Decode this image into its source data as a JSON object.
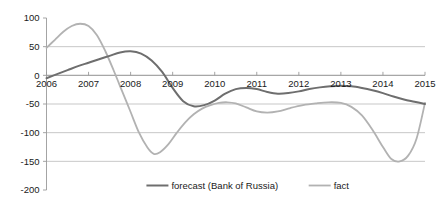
{
  "chart_data": {
    "type": "line",
    "title": "",
    "subtitle": "",
    "xlabel": "",
    "ylabel": "",
    "grid": true,
    "legend_position": "bottom",
    "xlim": [
      2006,
      2015
    ],
    "ylim": [
      -200,
      100
    ],
    "ytick_labels": [
      "100",
      "50",
      "0",
      "-50",
      "-100",
      "-150",
      "-200"
    ],
    "yticks": [
      100,
      50,
      0,
      -50,
      -100,
      -150,
      -200
    ],
    "xtick_labels": [
      "2006",
      "2007",
      "2008",
      "2009",
      "2010",
      "2011",
      "2012",
      "2013",
      "2014",
      "2015"
    ],
    "xticks": [
      2006,
      2007,
      2008,
      2009,
      2010,
      2011,
      2012,
      2013,
      2014,
      2015
    ],
    "series": [
      {
        "name": "forecast (Bank of Russia)",
        "color": "#6e6e6e",
        "width": 2.0,
        "x": [
          2006.0,
          2006.25,
          2006.5,
          2006.75,
          2007.0,
          2007.25,
          2007.5,
          2007.75,
          2008.0,
          2008.25,
          2008.5,
          2008.75,
          2009.0,
          2009.25,
          2009.5,
          2009.75,
          2010.0,
          2010.25,
          2010.5,
          2010.75,
          2011.0,
          2011.25,
          2011.5,
          2011.75,
          2012.0,
          2012.25,
          2012.5,
          2012.75,
          2013.0,
          2013.25,
          2013.5,
          2013.75,
          2014.0,
          2014.25,
          2014.5,
          2014.75,
          2015.0
        ],
        "values": [
          -5,
          2,
          9,
          16,
          22,
          28,
          34,
          40,
          42,
          38,
          26,
          6,
          -22,
          -45,
          -54,
          -52,
          -44,
          -32,
          -24,
          -22,
          -24,
          -29,
          -32,
          -31,
          -28,
          -24,
          -21,
          -19,
          -18,
          -19,
          -22,
          -26,
          -31,
          -37,
          -42,
          -46,
          -50
        ]
      },
      {
        "name": "fact",
        "color": "#b2b2b2",
        "width": 1.8,
        "x": [
          2006.0,
          2006.2,
          2006.4,
          2006.6,
          2006.8,
          2007.0,
          2007.2,
          2007.4,
          2007.6,
          2007.8,
          2008.0,
          2008.2,
          2008.4,
          2008.55,
          2008.7,
          2008.9,
          2009.1,
          2009.3,
          2009.5,
          2009.7,
          2009.9,
          2010.1,
          2010.3,
          2010.5,
          2010.75,
          2011.0,
          2011.25,
          2011.5,
          2011.8,
          2012.1,
          2012.4,
          2012.7,
          2013.0,
          2013.25,
          2013.5,
          2013.75,
          2014.0,
          2014.2,
          2014.4,
          2014.6,
          2014.8,
          2015.0
        ],
        "values": [
          48,
          62,
          76,
          86,
          90,
          86,
          70,
          42,
          8,
          -28,
          -64,
          -100,
          -126,
          -137,
          -134,
          -120,
          -100,
          -82,
          -68,
          -58,
          -52,
          -48,
          -47,
          -49,
          -56,
          -63,
          -65,
          -63,
          -57,
          -52,
          -49,
          -47,
          -48,
          -55,
          -70,
          -95,
          -125,
          -146,
          -150,
          -140,
          -110,
          -48
        ]
      }
    ],
    "legend": [
      {
        "label": "forecast (Bank of Russia)",
        "color": "#6e6e6e"
      },
      {
        "label": "fact",
        "color": "#b2b2b2"
      }
    ]
  }
}
